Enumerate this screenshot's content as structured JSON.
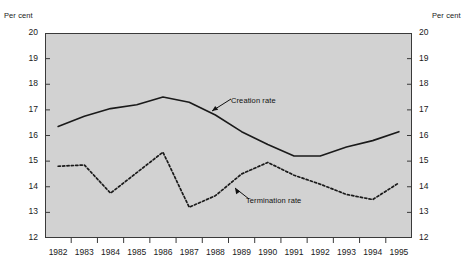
{
  "chart_data": {
    "type": "line",
    "title": "",
    "xlabel": "",
    "ylabel": "Per cent",
    "ylabel_right": "Per cent",
    "ylim": [
      12,
      20
    ],
    "xlim": [
      1982,
      1995
    ],
    "grid": false,
    "legend_position": "inline-annotations",
    "background": "#d2d2d2",
    "ytick_labels": [
      "20",
      "19",
      "18",
      "17",
      "16",
      "15",
      "14",
      "13",
      "12"
    ],
    "ytick_values": [
      20,
      19,
      18,
      17,
      16,
      15,
      14,
      13,
      12
    ],
    "xtick_labels": [
      "1982",
      "1983",
      "1984",
      "1985",
      "1986",
      "1987",
      "1988",
      "1989",
      "1990",
      "1991",
      "1992",
      "1993",
      "1994",
      "1995"
    ],
    "categories": [
      1982,
      1983,
      1984,
      1985,
      1986,
      1987,
      1988,
      1989,
      1990,
      1991,
      1992,
      1993,
      1994,
      1995
    ],
    "series": [
      {
        "name": "Creation rate",
        "style": "solid",
        "color": "#1a1a1a",
        "values": [
          16.35,
          16.75,
          17.05,
          17.2,
          17.5,
          17.3,
          16.8,
          16.15,
          15.65,
          15.2,
          15.2,
          15.55,
          15.8,
          16.15
        ]
      },
      {
        "name": "Termination rate",
        "style": "dotted",
        "color": "#1a1a1a",
        "values": [
          14.8,
          14.85,
          13.75,
          14.55,
          15.35,
          13.2,
          13.65,
          14.5,
          14.95,
          14.45,
          14.1,
          13.7,
          13.5,
          14.15
        ]
      }
    ],
    "annotations": [
      {
        "text": "Creation rate",
        "target_year": 1988,
        "target_value": 16.8
      },
      {
        "text": "Termination rate",
        "target_year": 1989,
        "target_value": 14.5
      }
    ]
  }
}
